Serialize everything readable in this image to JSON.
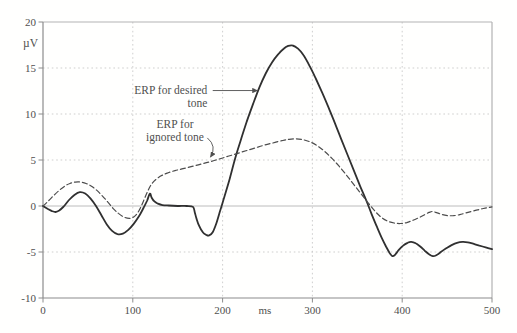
{
  "figure": {
    "background": "#fffffe",
    "frame_color": "#b3b3b3",
    "axis_color": "#8c8c8c",
    "grid_color": "#c9c9c9",
    "zero_line_color": "#bcbcbc",
    "text_color": "#4f4f4f",
    "solid_curve_color": "#303030",
    "dashed_curve_color": "#4c4c4c"
  },
  "chart_data": {
    "type": "line",
    "title": "",
    "xlabel": "ms",
    "ylabel": "µV",
    "xlim": [
      0,
      500
    ],
    "ylim": [
      -10,
      20
    ],
    "grid": true,
    "legend_position": "none",
    "x_ticks": [
      0,
      100,
      200,
      300,
      400,
      500
    ],
    "x_tick_labels": [
      "0",
      "100",
      "200",
      "300",
      "400",
      "500"
    ],
    "x_unit_label_ms": 247,
    "y_ticks": [
      20,
      15,
      10,
      5,
      0,
      -5,
      -10
    ],
    "y_tick_labels": [
      "20",
      "15",
      "10",
      "5",
      "0",
      "-5",
      "-10"
    ],
    "series": [
      {
        "name": "ERP for desired tone",
        "style": "solid",
        "points": [
          [
            0,
            0
          ],
          [
            5,
            -0.3
          ],
          [
            10,
            -0.55
          ],
          [
            14,
            -0.65
          ],
          [
            18,
            -0.5
          ],
          [
            23,
            -0.05
          ],
          [
            29,
            0.65
          ],
          [
            35,
            1.2
          ],
          [
            41,
            1.5
          ],
          [
            47,
            1.35
          ],
          [
            53,
            0.8
          ],
          [
            59,
            0
          ],
          [
            65,
            -1.0
          ],
          [
            71,
            -2.0
          ],
          [
            77,
            -2.7
          ],
          [
            83,
            -3.05
          ],
          [
            89,
            -3.0
          ],
          [
            95,
            -2.6
          ],
          [
            101,
            -1.95
          ],
          [
            107,
            -1.1
          ],
          [
            112,
            -0.2
          ],
          [
            116,
            0.6
          ],
          [
            119,
            1.35
          ],
          [
            121,
            0.9
          ],
          [
            124,
            0.5
          ],
          [
            128,
            0.25
          ],
          [
            133,
            0.1
          ],
          [
            140,
            0.05
          ],
          [
            150,
            0
          ],
          [
            160,
            0
          ],
          [
            167,
            -0.1
          ],
          [
            169,
            -0.7
          ],
          [
            171,
            -1.4
          ],
          [
            174,
            -2.2
          ],
          [
            178,
            -2.85
          ],
          [
            182,
            -3.15
          ],
          [
            185,
            -3.2
          ],
          [
            189,
            -2.85
          ],
          [
            193,
            -1.9
          ],
          [
            197,
            -0.6
          ],
          [
            202,
            1.0
          ],
          [
            208,
            3.0
          ],
          [
            214,
            5.2
          ],
          [
            220,
            7.1
          ],
          [
            227,
            9.2
          ],
          [
            234,
            11.1
          ],
          [
            241,
            12.9
          ],
          [
            248,
            14.4
          ],
          [
            255,
            15.6
          ],
          [
            262,
            16.5
          ],
          [
            268,
            17.1
          ],
          [
            273,
            17.4
          ],
          [
            278,
            17.45
          ],
          [
            284,
            17.1
          ],
          [
            290,
            16.4
          ],
          [
            297,
            15.2
          ],
          [
            304,
            13.8
          ],
          [
            311,
            12.3
          ],
          [
            318,
            10.7
          ],
          [
            325,
            9.0
          ],
          [
            332,
            7.3
          ],
          [
            339,
            5.6
          ],
          [
            346,
            3.9
          ],
          [
            353,
            2.2
          ],
          [
            360,
            0.6
          ],
          [
            366,
            -0.9
          ],
          [
            372,
            -2.3
          ],
          [
            377,
            -3.4
          ],
          [
            382,
            -4.4
          ],
          [
            386,
            -5.1
          ],
          [
            389,
            -5.45
          ],
          [
            392,
            -5.3
          ],
          [
            396,
            -4.8
          ],
          [
            401,
            -4.3
          ],
          [
            406,
            -4.0
          ],
          [
            410,
            -3.9
          ],
          [
            415,
            -4.05
          ],
          [
            420,
            -4.4
          ],
          [
            425,
            -4.85
          ],
          [
            430,
            -5.25
          ],
          [
            434,
            -5.45
          ],
          [
            438,
            -5.35
          ],
          [
            443,
            -5.0
          ],
          [
            449,
            -4.6
          ],
          [
            455,
            -4.25
          ],
          [
            461,
            -4.0
          ],
          [
            467,
            -3.9
          ],
          [
            473,
            -3.95
          ],
          [
            479,
            -4.1
          ],
          [
            486,
            -4.3
          ],
          [
            493,
            -4.5
          ],
          [
            500,
            -4.7
          ]
        ]
      },
      {
        "name": "ERP for ignored tone",
        "style": "dashed",
        "points": [
          [
            0,
            0
          ],
          [
            6,
            0.55
          ],
          [
            12,
            1.15
          ],
          [
            18,
            1.7
          ],
          [
            24,
            2.15
          ],
          [
            30,
            2.45
          ],
          [
            36,
            2.6
          ],
          [
            42,
            2.6
          ],
          [
            48,
            2.45
          ],
          [
            54,
            2.15
          ],
          [
            60,
            1.7
          ],
          [
            66,
            1.1
          ],
          [
            72,
            0.45
          ],
          [
            78,
            -0.25
          ],
          [
            84,
            -0.8
          ],
          [
            90,
            -1.2
          ],
          [
            96,
            -1.35
          ],
          [
            101,
            -1.2
          ],
          [
            105,
            -0.8
          ],
          [
            109,
            -0.1
          ],
          [
            113,
            0.8
          ],
          [
            117,
            1.7
          ],
          [
            121,
            2.4
          ],
          [
            126,
            2.9
          ],
          [
            132,
            3.3
          ],
          [
            139,
            3.6
          ],
          [
            147,
            3.85
          ],
          [
            156,
            4.05
          ],
          [
            166,
            4.3
          ],
          [
            176,
            4.55
          ],
          [
            186,
            4.8
          ],
          [
            196,
            5.1
          ],
          [
            206,
            5.4
          ],
          [
            216,
            5.7
          ],
          [
            226,
            6.0
          ],
          [
            236,
            6.3
          ],
          [
            246,
            6.6
          ],
          [
            256,
            6.85
          ],
          [
            266,
            7.1
          ],
          [
            274,
            7.25
          ],
          [
            282,
            7.3
          ],
          [
            290,
            7.2
          ],
          [
            298,
            6.95
          ],
          [
            306,
            6.5
          ],
          [
            314,
            5.9
          ],
          [
            322,
            5.15
          ],
          [
            330,
            4.3
          ],
          [
            338,
            3.35
          ],
          [
            346,
            2.35
          ],
          [
            354,
            1.35
          ],
          [
            362,
            0.35
          ],
          [
            370,
            -0.6
          ],
          [
            377,
            -1.25
          ],
          [
            384,
            -1.65
          ],
          [
            391,
            -1.85
          ],
          [
            398,
            -1.9
          ],
          [
            405,
            -1.8
          ],
          [
            412,
            -1.55
          ],
          [
            419,
            -1.25
          ],
          [
            425,
            -0.95
          ],
          [
            430,
            -0.7
          ],
          [
            434,
            -0.6
          ],
          [
            439,
            -0.75
          ],
          [
            445,
            -0.95
          ],
          [
            451,
            -1.05
          ],
          [
            457,
            -1.05
          ],
          [
            464,
            -0.95
          ],
          [
            471,
            -0.75
          ],
          [
            479,
            -0.55
          ],
          [
            487,
            -0.35
          ],
          [
            494,
            -0.2
          ],
          [
            500,
            -0.1
          ]
        ]
      }
    ],
    "annotations": [
      {
        "id": "desired-tone",
        "lines": [
          "ERP for desired",
          "tone"
        ],
        "align": "end",
        "pos": {
          "ms": 183,
          "uv": 12.6
        },
        "arrow": {
          "from": {
            "ms": 189,
            "uv": 12.55
          },
          "to": {
            "ms": 239,
            "uv": 12.55
          },
          "curve": null
        }
      },
      {
        "id": "ignored-tone",
        "lines": [
          "ERP for",
          "ignored tone"
        ],
        "align": "middle",
        "pos": {
          "ms": 147,
          "uv": 8.85
        },
        "arrow": {
          "from": {
            "ms": 183,
            "uv": 7.4
          },
          "to": {
            "ms": 186.5,
            "uv": 5.3
          },
          "curve": {
            "ms": 194,
            "uv": 6.5
          }
        }
      }
    ]
  }
}
